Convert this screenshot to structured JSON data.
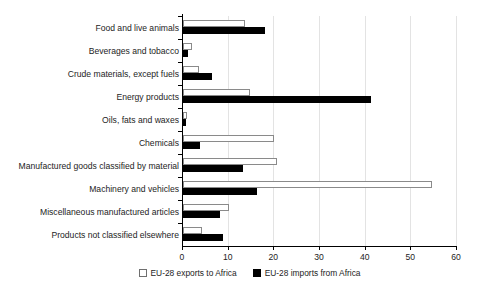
{
  "chart_data": {
    "type": "bar",
    "orientation": "horizontal",
    "title": "",
    "subtitle": "",
    "xlabel": "",
    "ylabel": "",
    "xlim": [
      0,
      60
    ],
    "xticks": [
      0,
      10,
      20,
      30,
      40,
      50,
      60
    ],
    "grid": true,
    "legend_position": "bottom-center",
    "categories": [
      "Food and live animals",
      "Beverages and tobacco",
      "Crude materials, except fuels",
      "Energy products",
      "Oils, fats and waxes",
      "Chemicals",
      "Manufactured goods classified by material",
      "Machinery and vehicles",
      "Miscellaneous manufactured articles",
      "Products not classified elsewhere"
    ],
    "series": [
      {
        "name": "EU-28 exports to Africa",
        "color": "#ffffff",
        "edge_color": "#8a8a8a",
        "values": [
          13.6,
          1.9,
          3.5,
          14.6,
          0.8,
          20.0,
          20.6,
          54.5,
          10.1,
          4.2
        ]
      },
      {
        "name": "EU-28 imports from Africa",
        "color": "#000000",
        "edge_color": "#000000",
        "values": [
          17.9,
          1.1,
          6.4,
          41.2,
          0.6,
          3.8,
          13.2,
          16.2,
          8.2,
          8.7
        ]
      }
    ]
  },
  "legend": {
    "items": [
      {
        "label": "EU-28 exports to Africa",
        "swatch": "hollow-square-icon"
      },
      {
        "label": "EU-28 imports from Africa",
        "swatch": "filled-square-icon"
      }
    ]
  },
  "axis": {
    "tick_labels": [
      "0",
      "10",
      "20",
      "30",
      "40",
      "50",
      "60"
    ]
  }
}
